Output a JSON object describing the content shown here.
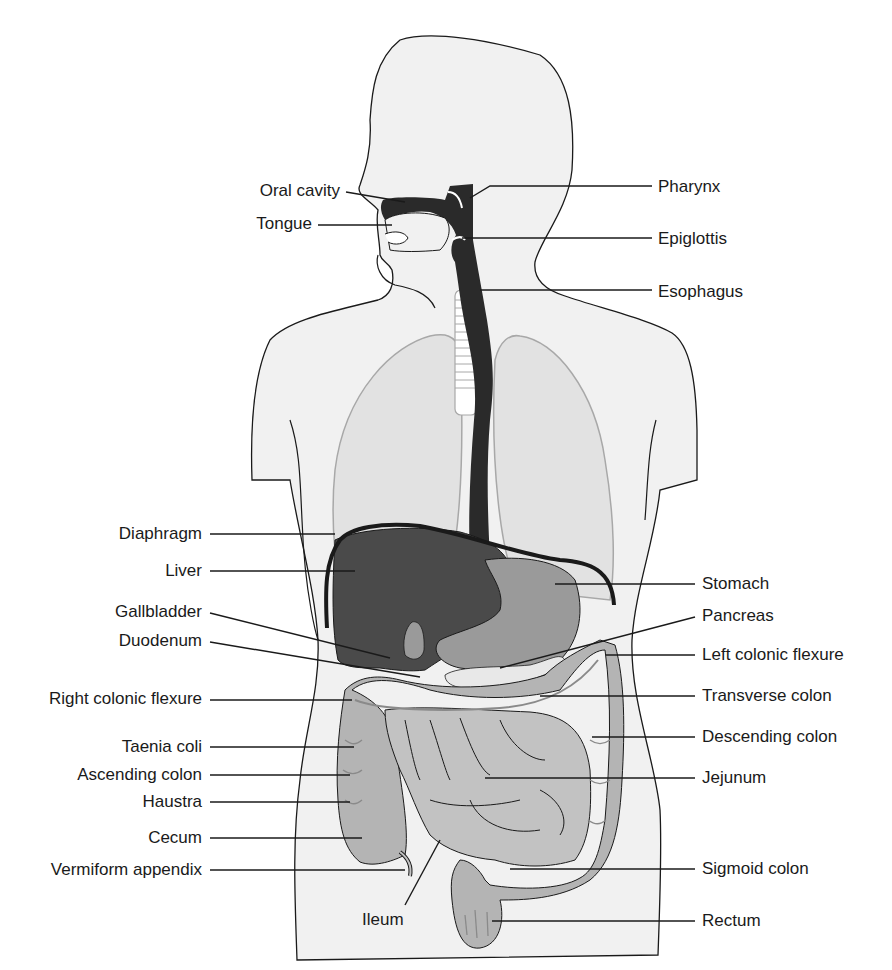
{
  "figure": {
    "colors": {
      "background": "#ffffff",
      "body_fill": "#f1f1f1",
      "outline": "#1a1a1a",
      "lung_fill": "#e2e2e2",
      "lung_stroke": "#a8a8a8",
      "dark_tract": "#2a2a2a",
      "liver": "#4a4a4a",
      "stomach": "#9a9a9a",
      "colon": "#b4b4b4",
      "small_intestine": "#c2c2c2",
      "leader_line": "#1a1a1a"
    }
  },
  "labels_left": [
    {
      "text": "Oral cavity",
      "x_right": 340,
      "y": 191
    },
    {
      "text": "Tongue",
      "x_right": 312,
      "y": 224
    },
    {
      "text": "Diaphragm",
      "x_right": 202,
      "y": 534
    },
    {
      "text": "Liver",
      "x_right": 202,
      "y": 571
    },
    {
      "text": "Gallbladder",
      "x_right": 202,
      "y": 612
    },
    {
      "text": "Duodenum",
      "x_right": 202,
      "y": 641
    },
    {
      "text": "Right colonic flexure",
      "x_right": 202,
      "y": 699
    },
    {
      "text": "Taenia coli",
      "x_right": 202,
      "y": 747
    },
    {
      "text": "Ascending colon",
      "x_right": 202,
      "y": 775
    },
    {
      "text": "Haustra",
      "x_right": 202,
      "y": 802
    },
    {
      "text": "Cecum",
      "x_right": 202,
      "y": 838
    },
    {
      "text": "Vermiform appendix",
      "x_right": 202,
      "y": 870
    }
  ],
  "labels_right": [
    {
      "text": "Pharynx",
      "x_left": 658,
      "y": 187
    },
    {
      "text": "Epiglottis",
      "x_left": 658,
      "y": 239
    },
    {
      "text": "Esophagus",
      "x_left": 658,
      "y": 292
    },
    {
      "text": "Stomach",
      "x_left": 702,
      "y": 584
    },
    {
      "text": "Pancreas",
      "x_left": 702,
      "y": 616
    },
    {
      "text": "Left colonic flexure",
      "x_left": 702,
      "y": 655
    },
    {
      "text": "Transverse colon",
      "x_left": 702,
      "y": 696
    },
    {
      "text": "Descending colon",
      "x_left": 702,
      "y": 737
    },
    {
      "text": "Jejunum",
      "x_left": 702,
      "y": 778
    },
    {
      "text": "Sigmoid colon",
      "x_left": 702,
      "y": 869
    },
    {
      "text": "Rectum",
      "x_left": 702,
      "y": 922
    }
  ],
  "labels_bottom": [
    {
      "text": "Ileum",
      "x_center": 385,
      "y": 920
    }
  ]
}
